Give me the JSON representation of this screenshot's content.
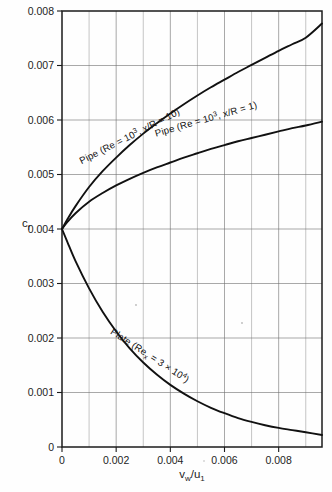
{
  "figure": {
    "background_color": "#fefefe",
    "ink_color": "#111111",
    "grid_color": "#6f6f6f"
  },
  "axes": {
    "y_title": "c",
    "y_title_sub": "f",
    "x_title_v": "v",
    "x_title_v_sub": "w",
    "x_title_slash": "/u",
    "x_title_u_sub": "1"
  },
  "chart_data": {
    "type": "line",
    "title": "",
    "xlabel": "v_w/u_1",
    "ylabel": "c_f",
    "xlim": [
      0,
      0.0096
    ],
    "ylim": [
      0,
      0.008
    ],
    "grid": true,
    "legend": "inline curve labels",
    "x_ticks": [
      0,
      0.002,
      0.004,
      0.006,
      0.008
    ],
    "x_tick_labels": [
      "0",
      "0.002",
      "0.004",
      "0.006",
      "0.008"
    ],
    "x_minor_step": 0.001,
    "y_ticks": [
      0,
      0.001,
      0.002,
      0.003,
      0.004,
      0.005,
      0.006,
      0.007,
      0.008
    ],
    "y_tick_labels": [
      "0",
      "0.001",
      "0.002",
      "0.003",
      "0.004",
      "0.005",
      "0.006",
      "0.007",
      "0.008"
    ],
    "series": [
      {
        "name": "Pipe (Re = 10^3, x/R = 10)",
        "label_parts": {
          "pre": "Pipe (Re = 10",
          "sup": "3",
          "post": ", x/R = 10)"
        },
        "label_rotation_deg": -27,
        "label_x": 0.00255,
        "label_y": 0.00565,
        "x": [
          0,
          0.0002,
          0.0005,
          0.001,
          0.0015,
          0.002,
          0.0025,
          0.003,
          0.0035,
          0.004,
          0.0045,
          0.005,
          0.0055,
          0.006,
          0.0065,
          0.007,
          0.0075,
          0.008,
          0.0085,
          0.009,
          0.0096
        ],
        "y": [
          0.004,
          0.00418,
          0.00442,
          0.00477,
          0.00506,
          0.00531,
          0.00554,
          0.00575,
          0.00594,
          0.00612,
          0.00629,
          0.00645,
          0.0066,
          0.00674,
          0.00688,
          0.00701,
          0.00714,
          0.00727,
          0.00739,
          0.00751,
          0.00777
        ]
      },
      {
        "name": "Pipe (Re = 10^3, x/R = 1)",
        "label_parts": {
          "pre": "Pipe (Re = 10",
          "sup": "3",
          "post": ", x/R = 1)"
        },
        "label_rotation_deg": -16,
        "label_x": 0.00535,
        "label_y": 0.00596,
        "x": [
          0,
          0.0002,
          0.0005,
          0.001,
          0.0015,
          0.002,
          0.0025,
          0.003,
          0.0035,
          0.004,
          0.0045,
          0.005,
          0.0055,
          0.006,
          0.0065,
          0.007,
          0.0075,
          0.008,
          0.0085,
          0.009,
          0.0096
        ],
        "y": [
          0.004,
          0.00413,
          0.00429,
          0.0045,
          0.00466,
          0.0048,
          0.00492,
          0.00503,
          0.00513,
          0.00522,
          0.00531,
          0.00539,
          0.00547,
          0.00554,
          0.00561,
          0.00567,
          0.00573,
          0.00579,
          0.00585,
          0.0059,
          0.00597
        ]
      },
      {
        "name": "Plate (Re_x = 3 × 10^4)",
        "label_parts": {
          "pre": "Plate (Re",
          "sub": "x",
          "mid": " = 3 ",
          "times": "×",
          "mid2": " 10",
          "sup": "4",
          "post": ")"
        },
        "label_rotation_deg": 33,
        "label_x": 0.00318,
        "label_y": 0.00163,
        "x": [
          0,
          0.0002,
          0.0005,
          0.001,
          0.0015,
          0.002,
          0.0025,
          0.003,
          0.0035,
          0.004,
          0.0045,
          0.005,
          0.0055,
          0.006,
          0.0065,
          0.007,
          0.0075,
          0.008,
          0.0085,
          0.009,
          0.0096
        ],
        "y": [
          0.004,
          0.00376,
          0.00341,
          0.00291,
          0.00248,
          0.00212,
          0.00181,
          0.00155,
          0.00133,
          0.00114,
          0.00098,
          0.00084,
          0.00072,
          0.00062,
          0.00053,
          0.00046,
          0.0004,
          0.00035,
          0.00031,
          0.00027,
          0.00022
        ]
      }
    ]
  }
}
